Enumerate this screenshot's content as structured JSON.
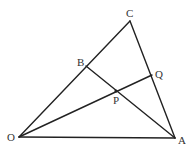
{
  "diagram": {
    "title": "",
    "points": {
      "O": {
        "x": 19,
        "y": 137,
        "label": "O",
        "lx": 7,
        "ly": 141
      },
      "A": {
        "x": 175,
        "y": 138,
        "label": "A",
        "lx": 178,
        "ly": 144
      },
      "C": {
        "x": 130,
        "y": 21,
        "label": "C",
        "lx": 126,
        "ly": 17
      },
      "B": {
        "x": 86,
        "y": 66,
        "label": "B",
        "lx": 77,
        "ly": 66
      },
      "Q": {
        "x": 152,
        "y": 75,
        "label": "Q",
        "lx": 155,
        "ly": 78
      },
      "P": {
        "x": 116,
        "y": 91,
        "label": "P",
        "lx": 113,
        "ly": 104
      }
    },
    "segments": [
      {
        "from": "O",
        "to": "A"
      },
      {
        "from": "O",
        "to": "C"
      },
      {
        "from": "C",
        "to": "A"
      },
      {
        "from": "B",
        "to": "A"
      },
      {
        "from": "O",
        "to": "Q"
      }
    ],
    "labels": {
      "O": "O",
      "A": "A",
      "C": "C",
      "B": "B",
      "Q": "Q",
      "P": "P"
    },
    "colors": {
      "line": "#222222",
      "text": "#333333",
      "background": "#ffffff"
    }
  }
}
